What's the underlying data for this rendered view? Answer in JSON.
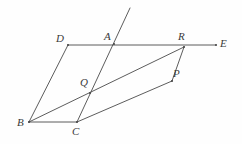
{
  "figure": {
    "type": "geometry-diagram",
    "width": 242,
    "height": 144,
    "background_color": "#fefefe",
    "stroke_color": "#4a4a4a",
    "stroke_width": 0.9,
    "label_color": "#3a3a3a"
  },
  "points": [
    {
      "id": "A",
      "label": "A",
      "x": 114,
      "y": 44,
      "label_x": 104,
      "label_y": 31
    },
    {
      "id": "B",
      "label": "B",
      "x": 29,
      "y": 122,
      "label_x": 17,
      "label_y": 117
    },
    {
      "id": "C",
      "label": "C",
      "x": 77,
      "y": 122,
      "label_x": 72,
      "label_y": 126
    },
    {
      "id": "D",
      "label": "D",
      "x": 68,
      "y": 45,
      "label_x": 56,
      "label_y": 33
    },
    {
      "id": "E",
      "label": "E",
      "x": 216,
      "y": 45,
      "label_x": 220,
      "label_y": 38
    },
    {
      "id": "P",
      "label": "P",
      "x": 172,
      "y": 81,
      "label_x": 173,
      "label_y": 68
    },
    {
      "id": "Q",
      "label": "Q",
      "x": 90,
      "y": 93,
      "label_x": 80,
      "label_y": 77
    },
    {
      "id": "R",
      "label": "R",
      "x": 184,
      "y": 47,
      "label_x": 178,
      "label_y": 31
    }
  ],
  "segments": [
    {
      "id": "seg-DE",
      "name": "segment-d-to-e",
      "x1": 68,
      "y1": 45,
      "x2": 216,
      "y2": 45
    },
    {
      "id": "seg-DB",
      "name": "segment-d-to-b",
      "x1": 68,
      "y1": 45,
      "x2": 29,
      "y2": 122
    },
    {
      "id": "seg-BC",
      "name": "segment-b-to-c",
      "x1": 29,
      "y1": 122,
      "x2": 77,
      "y2": 122
    },
    {
      "id": "seg-BR",
      "name": "diagonal-b-through-q-to-r",
      "x1": 29,
      "y1": 122,
      "x2": 184,
      "y2": 47
    },
    {
      "id": "seg-CP",
      "name": "segment-c-to-p",
      "x1": 77,
      "y1": 122,
      "x2": 172,
      "y2": 81
    },
    {
      "id": "seg-PR",
      "name": "segment-p-to-r",
      "x1": 172,
      "y1": 81,
      "x2": 184,
      "y2": 47
    },
    {
      "id": "seg-TC",
      "name": "transversal-through-a-q-to-c",
      "x1": 130,
      "y1": 8,
      "x2": 77,
      "y2": 122
    }
  ]
}
